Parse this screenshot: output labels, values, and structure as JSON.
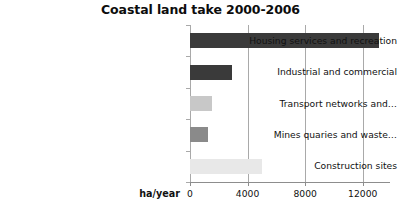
{
  "chart_data": {
    "type": "bar",
    "orientation": "horizontal",
    "title": "Coastal land take 2000-2006",
    "xlabel": "ha/year",
    "ylabel": "",
    "categories": [
      "Housing services and recreation",
      "Industrial and commercial",
      "Transport networks and…",
      "Mines quaries and waste…",
      "Construction sites"
    ],
    "values": [
      13160,
      2900,
      1500,
      1250,
      5000
    ],
    "bar_colors": [
      "#3a3a3a",
      "#3a3a3a",
      "#c8c8c8",
      "#8a8a8a",
      "#e8e8e8"
    ],
    "xlim": [
      0,
      13200
    ],
    "xticks": [
      0,
      4000,
      8000,
      12000
    ],
    "xtick_labels": [
      "0",
      "4000",
      "8000",
      "12000"
    ],
    "grid": true,
    "grid_axis": "x",
    "legend": null
  },
  "style": {
    "background": "#ffffff",
    "text_color": "#111111",
    "grid_color": "#a9a9a9",
    "axis_color": "#8d8d8d"
  }
}
